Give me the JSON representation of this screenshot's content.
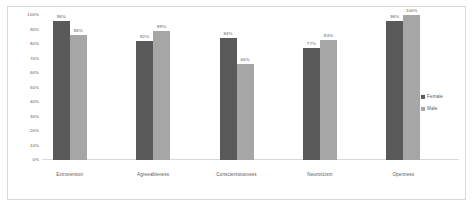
{
  "chart_data": {
    "type": "bar",
    "title": "",
    "xlabel": "",
    "ylabel": "",
    "ylim": [
      0,
      100
    ],
    "grid": false,
    "legend_position": "right",
    "categories": [
      "Extroversion",
      "Agreeableness",
      "Conscientiousness",
      "Neuroticism",
      "Openness"
    ],
    "series": [
      {
        "name": "Female",
        "color": "#595959",
        "values": [
          96,
          82,
          84,
          77,
          96
        ],
        "labels": [
          "96%",
          "82%",
          "84%",
          "77%",
          "96%"
        ]
      },
      {
        "name": "Male",
        "color": "#a6a6a6",
        "values": [
          86,
          89,
          66,
          83,
          100
        ],
        "labels": [
          "86%",
          "89%",
          "66%",
          "83%",
          "100%"
        ]
      }
    ],
    "y_ticks": [
      "100%",
      "90%",
      "80%",
      "70%",
      "60%",
      "50%",
      "40%",
      "30%",
      "20%",
      "10%",
      "0%"
    ],
    "y_tick_values": [
      100,
      90,
      80,
      70,
      60,
      50,
      40,
      30,
      20,
      10,
      0
    ]
  },
  "legend": {
    "items": [
      {
        "label": "Female",
        "color": "#595959"
      },
      {
        "label": "Male",
        "color": "#a6a6a6"
      }
    ]
  },
  "colors": {
    "female": "#595959",
    "male": "#a6a6a6",
    "axis": "#d9d9d9",
    "text": "#595959",
    "background": "#ffffff",
    "border": "#d9d9d9"
  }
}
